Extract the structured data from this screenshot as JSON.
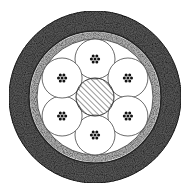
{
  "diagram": {
    "type": "cable-cross-section",
    "center": [
      95,
      97
    ],
    "layers": {
      "outer_sheath": {
        "outer_r": 86,
        "inner_r": 67,
        "fill": "#5a5a5a"
      },
      "divider_ring": {
        "r": 66,
        "stroke": "#222222"
      },
      "inner_sheath": {
        "outer_r": 65,
        "inner_r": 58,
        "fill": "#b8b8b8"
      },
      "core_area": {
        "r": 58,
        "fill": "#ffffff"
      }
    },
    "central_member": {
      "r": 19,
      "pattern": "hatched"
    },
    "bundles": {
      "count": 6,
      "orbit_r": 38,
      "r": 20,
      "start_angle_deg": -90,
      "dots_per_bundle": 7
    }
  }
}
